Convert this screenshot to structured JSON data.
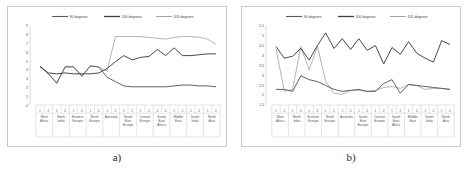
{
  "figure": {
    "panels": [
      {
        "caption": "a)",
        "id": "panel-a"
      },
      {
        "caption": "b)",
        "id": "panel-b"
      }
    ]
  },
  "legend": {
    "position": "top-center",
    "entries": [
      {
        "label": "90 degrees",
        "color": "#595959"
      },
      {
        "label": "100 degrees",
        "color": "#3f3f3f"
      },
      {
        "label": "105 degrees",
        "color": "#a6a6a6"
      }
    ]
  },
  "categories": [
    "West Africa",
    "North India",
    "Eastern Europe",
    "North Europe",
    "Australia",
    "South East Europe",
    "Central Europe",
    "South East Africa",
    "Middle East",
    "South India",
    "North Asia"
  ],
  "sub_ticks": [
    "1",
    "2"
  ],
  "chart_data": [
    {
      "id": "chart-a",
      "type": "line",
      "title": "",
      "xlabel": "",
      "ylabel": "",
      "ylim": [
        0,
        9
      ],
      "yticks": [
        "0",
        "1",
        "2",
        "3",
        "4",
        "5",
        "6",
        "7",
        "8",
        "9"
      ],
      "grid": false,
      "legend_position": "top-center",
      "categories": [
        "West Africa",
        "North India",
        "Eastern Europe",
        "North Europe",
        "Australia",
        "South East Europe",
        "Central Europe",
        "South East Africa",
        "Middle East",
        "South India",
        "North Asia"
      ],
      "x": [
        "1",
        "2",
        "1",
        "2",
        "1",
        "2",
        "1",
        "2",
        "1",
        "2",
        "1",
        "2",
        "1",
        "2",
        "1",
        "2",
        "1",
        "2",
        "1",
        "2",
        "1",
        "2"
      ],
      "series": [
        {
          "name": "90 degrees",
          "color": "#595959",
          "values": [
            4.5,
            3.6,
            2.5,
            4.4,
            4.4,
            3.3,
            4.5,
            4.4,
            3.2,
            2.7,
            2.2,
            2.1,
            2.1,
            2.1,
            2.1,
            2.1,
            2.2,
            2.3,
            2.3,
            2.2,
            2.2,
            2.1
          ]
        },
        {
          "name": "100 degrees",
          "color": "#3f3f3f",
          "values": [
            4.4,
            3.7,
            3.6,
            3.7,
            3.6,
            3.6,
            3.6,
            3.7,
            4.2,
            5.0,
            5.7,
            5.2,
            5.5,
            5.6,
            6.4,
            5.7,
            6.6,
            5.7,
            5.7,
            5.8,
            5.9,
            5.9
          ]
        },
        {
          "name": "105 degrees",
          "color": "#a6a6a6",
          "values": [
            4.5,
            3.6,
            2.6,
            4.4,
            4.4,
            3.4,
            4.5,
            4.4,
            3.9,
            7.9,
            7.9,
            7.9,
            7.9,
            7.8,
            7.7,
            7.6,
            7.8,
            7.9,
            7.9,
            7.8,
            7.6,
            7.0
          ]
        }
      ]
    },
    {
      "id": "chart-b",
      "type": "line",
      "title": "",
      "xlabel": "",
      "ylabel": "",
      "ylim": [
        1.5,
        5.5
      ],
      "yticks": [
        "1.5",
        "2",
        "2.5",
        "3",
        "3.5",
        "4",
        "4.5",
        "5",
        "5.5"
      ],
      "grid": false,
      "legend_position": "top-center",
      "categories": [
        "West Africa",
        "North India",
        "Eastern Europe",
        "North Europe",
        "Australia",
        "South East Europe",
        "Central Europe",
        "South East Africa",
        "Middle East",
        "South India",
        "North Asia"
      ],
      "x": [
        "1",
        "2",
        "1",
        "2",
        "1",
        "2",
        "1",
        "2",
        "1",
        "2",
        "1",
        "2",
        "1",
        "2",
        "1",
        "2",
        "1",
        "2",
        "1",
        "2",
        "1",
        "2"
      ],
      "series": [
        {
          "name": "90 degrees",
          "color": "#595959",
          "values": [
            2.3,
            2.3,
            2.2,
            3.0,
            2.8,
            2.7,
            2.5,
            2.3,
            2.2,
            2.25,
            2.3,
            2.2,
            2.2,
            2.6,
            2.8,
            2.1,
            2.55,
            2.5,
            2.45,
            2.4,
            2.35,
            2.3
          ]
        },
        {
          "name": "100 degrees",
          "color": "#3f3f3f",
          "values": [
            4.5,
            3.9,
            4.0,
            4.4,
            3.8,
            4.55,
            5.2,
            4.4,
            4.9,
            4.35,
            4.9,
            4.3,
            4.55,
            3.6,
            4.45,
            4.1,
            4.75,
            4.15,
            3.9,
            3.7,
            4.8,
            4.6
          ]
        },
        {
          "name": "105 degrees",
          "color": "#a6a6a6",
          "values": [
            4.4,
            2.2,
            2.3,
            4.5,
            3.3,
            4.5,
            2.7,
            2.1,
            2.05,
            2.25,
            2.25,
            2.2,
            2.25,
            2.4,
            2.45,
            2.35,
            2.55,
            2.5,
            2.3,
            2.35,
            2.35,
            2.3
          ]
        }
      ]
    }
  ]
}
